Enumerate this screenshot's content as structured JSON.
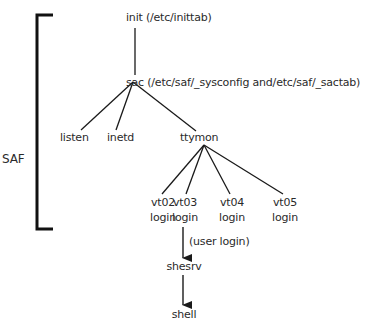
{
  "bracket": {
    "label": "SAF"
  },
  "nodes": {
    "init": "init (/etc/inittab)",
    "sac": "sac (/etc/saf/_sysconfig and/etc/saf/_sactab)",
    "listen": "listen",
    "inetd": "inetd",
    "ttymon": "ttymon",
    "vt02": {
      "name": "vt02",
      "sub": "login"
    },
    "vt03": {
      "name": "vt03",
      "sub": "login"
    },
    "vt04": {
      "name": "vt04",
      "sub": "login"
    },
    "vt05": {
      "name": "vt05",
      "sub": "login"
    },
    "shesrv": "shesrv",
    "shell": "shell"
  },
  "edge_labels": {
    "user_login": "(user login)"
  },
  "colors": {
    "line": "#1a1a1a",
    "text": "#2a2a2a"
  }
}
